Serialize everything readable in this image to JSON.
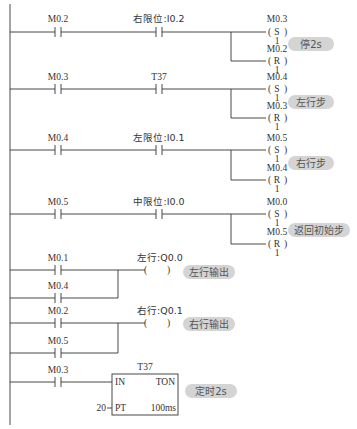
{
  "rungs": [
    {
      "contacts": [
        {
          "label": "M0.2"
        },
        {
          "label": "右限位:I0.2"
        }
      ],
      "coils": [
        {
          "address": "M0.3",
          "type": "S",
          "count": "1"
        },
        {
          "address": "M0.2",
          "type": "R",
          "count": "1"
        }
      ],
      "annotation": "停2s"
    },
    {
      "contacts": [
        {
          "label": "M0.3"
        },
        {
          "label": "T37"
        }
      ],
      "coils": [
        {
          "address": "M0.4",
          "type": "S",
          "count": "1"
        },
        {
          "address": "M0.3",
          "type": "R",
          "count": "1"
        }
      ],
      "annotation": "左行步"
    },
    {
      "contacts": [
        {
          "label": "M0.4"
        },
        {
          "label": "左限位:I0.1"
        }
      ],
      "coils": [
        {
          "address": "M0.5",
          "type": "S",
          "count": "1"
        },
        {
          "address": "M0.4",
          "type": "R",
          "count": "1"
        }
      ],
      "annotation": "右行步"
    },
    {
      "contacts": [
        {
          "label": "M0.5"
        },
        {
          "label": "中限位:I0.0"
        }
      ],
      "coils": [
        {
          "address": "M0.0",
          "type": "S",
          "count": "1"
        },
        {
          "address": "M0.5",
          "type": "R",
          "count": "1"
        }
      ],
      "annotation": "返回初始步"
    },
    {
      "contacts": [
        {
          "label": "M0.1"
        },
        {
          "label": "M0.4"
        }
      ],
      "coil": {
        "label": "左行:Q0.0",
        "open": "(",
        "close": ")"
      },
      "annotation": "左行输出"
    },
    {
      "contacts": [
        {
          "label": "M0.2"
        },
        {
          "label": "M0.5"
        }
      ],
      "coil": {
        "label": "右行:Q0.1",
        "open": "(",
        "close": ")"
      },
      "annotation": "右行输出"
    },
    {
      "contacts": [
        {
          "label": "M0.3"
        }
      ],
      "timer": {
        "name": "T37",
        "in": "IN",
        "type": "TON",
        "pt_label": "PT",
        "pt_value": "20",
        "base": "100ms"
      },
      "annotation": "定时2s"
    }
  ]
}
